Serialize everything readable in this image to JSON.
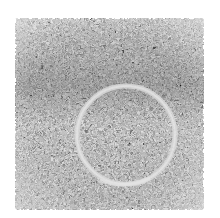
{
  "image": {
    "description": "Noisy grayscale texture square containing a faint bright circular ring",
    "background_color": "#ffffff",
    "texture": {
      "x": 15,
      "y": 18,
      "width": 189,
      "height": 192,
      "base_color": "#8a8a8a",
      "dark_band_color": "#5a5a5a"
    },
    "ring": {
      "cx": 126,
      "cy": 135,
      "r": 49,
      "stroke_width": 5,
      "color": "#d6d6d6"
    }
  }
}
